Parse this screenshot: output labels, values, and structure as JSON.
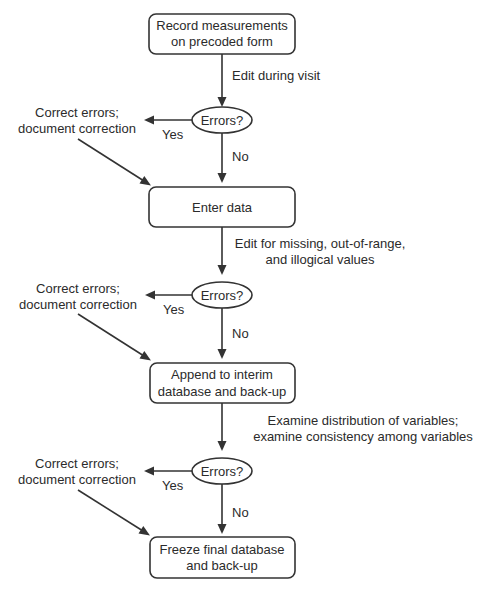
{
  "diagram": {
    "type": "flowchart",
    "colors": {
      "stroke": "#333333",
      "text": "#2b2b2b",
      "background": "#ffffff"
    },
    "steps": [
      {
        "id": "record",
        "lines": [
          "Record measurements",
          "on precoded form"
        ]
      },
      {
        "id": "enter",
        "lines": [
          "Enter data"
        ]
      },
      {
        "id": "append",
        "lines": [
          "Append to interim",
          "database and back-up"
        ]
      },
      {
        "id": "freeze",
        "lines": [
          "Freeze final database",
          "and back-up"
        ]
      }
    ],
    "checks": [
      {
        "edit_lines": [
          "Edit during visit"
        ],
        "decision": "Errors?",
        "yes_label": "Yes",
        "no_label": "No",
        "correction_lines": [
          "Correct errors;",
          "document correction"
        ]
      },
      {
        "edit_lines": [
          "Edit for missing, out-of-range,",
          "and illogical values"
        ],
        "decision": "Errors?",
        "yes_label": "Yes",
        "no_label": "No",
        "correction_lines": [
          "Correct errors;",
          "document correction"
        ]
      },
      {
        "edit_lines": [
          "Examine distribution of variables;",
          "examine consistency among variables"
        ],
        "decision": "Errors?",
        "yes_label": "Yes",
        "no_label": "No",
        "correction_lines": [
          "Correct errors;",
          "document correction"
        ]
      }
    ]
  }
}
